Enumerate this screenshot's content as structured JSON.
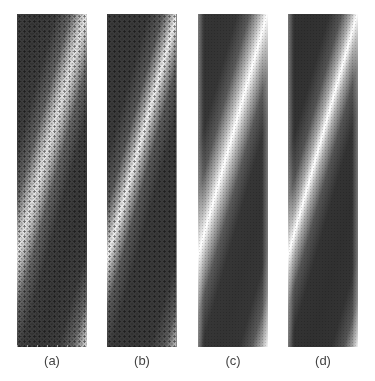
{
  "figure": {
    "panels": [
      {
        "id": "a",
        "label": "(a)",
        "style": "simulated lattice, noisy"
      },
      {
        "id": "b",
        "label": "(b)",
        "style": "simulated lattice, sharper"
      },
      {
        "id": "c",
        "label": "(c)",
        "style": "smoothed, blurred"
      },
      {
        "id": "d",
        "label": "(d)",
        "style": "smoothed, clean"
      }
    ],
    "colors": {
      "dark_band": "#3a3a3a",
      "light_band": "#ffffff",
      "label_text": "#444444",
      "background": "#ffffff"
    }
  }
}
